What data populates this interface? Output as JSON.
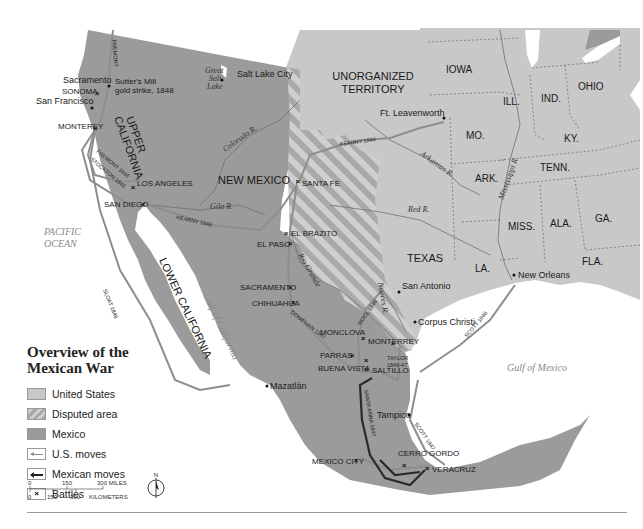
{
  "title": "Overview of the Mexican War",
  "title_lines": [
    "Overview of the",
    "Mexican War"
  ],
  "colors": {
    "united_states": "#c8c8c8",
    "mexico": "#9b9b9b",
    "disputed_stripe_a": "#a5a5a5",
    "disputed_stripe_b": "#cfcfcf",
    "us_moves": "#8e8e8e",
    "mexican_moves": "#2a2a2a",
    "water": "#ffffff"
  },
  "legend": {
    "items": [
      {
        "key": "united_states",
        "label": "United States"
      },
      {
        "key": "disputed",
        "label": "Disputed area"
      },
      {
        "key": "mexico",
        "label": "Mexico"
      },
      {
        "key": "us_moves",
        "label": "U.S. moves"
      },
      {
        "key": "mexican_moves",
        "label": "Mexican moves"
      },
      {
        "key": "battles",
        "label": "Battles",
        "symbol": "×"
      }
    ]
  },
  "scale": {
    "miles_ticks": [
      "0",
      "150",
      "300 MILES"
    ],
    "km_ticks": [
      "0",
      "150",
      "300",
      "KILOMETERS"
    ]
  },
  "compass": {
    "label": "N",
    "icon": "north-arrow-icon"
  },
  "regions": {
    "unorganized_territory": [
      "UNORGANIZED",
      "TERRITORY"
    ],
    "upper_california": [
      "UPPER",
      "CALIFORNIA"
    ],
    "lower_california": "LOWER CALIFORNIA",
    "new_mexico": "NEW MEXICO",
    "texas": "TEXAS"
  },
  "states": [
    "IOWA",
    "ILL.",
    "IND.",
    "OHIO",
    "MO.",
    "KY.",
    "TENN.",
    "ARK.",
    "MISS.",
    "ALA.",
    "GA.",
    "LA.",
    "FLA."
  ],
  "water_bodies": {
    "pacific": [
      "PACIFIC",
      "OCEAN"
    ],
    "gulf_of_mexico": "Gulf of Mexico",
    "gulf_of_california": "Gulf of California",
    "great_salt_lake": [
      "Great",
      "Salt",
      "Lake"
    ]
  },
  "rivers": [
    "Colorado R.",
    "Gila R.",
    "Rio Grande",
    "Nueces R.",
    "Arkansas R.",
    "Red R.",
    "Mississippi R."
  ],
  "cities": [
    {
      "name": "Sacramento"
    },
    {
      "name": "San Francisco"
    },
    {
      "name": "Salt Lake City"
    },
    {
      "name": "Ft. Leavenworth"
    },
    {
      "name": "San Antonio"
    },
    {
      "name": "Corpus Christi"
    },
    {
      "name": "New Orleans"
    },
    {
      "name": "Tampico"
    },
    {
      "name": "Mazatlán"
    }
  ],
  "annotations": {
    "sutters_mill": [
      "Sutter's Mill",
      "gold strike, 1848"
    ]
  },
  "battles": [
    "SONOMA",
    "MONTEREY",
    "LOS ANGELES",
    "SAN DIEGO",
    "SANTA FE",
    "EL BRAZITO",
    "EL PASO",
    "SACRAMENTO",
    "CHIHUAHUA",
    "MONCLOVA",
    "MONTERREY",
    "PARRAS",
    "BUENA VISTA",
    "SALTILLO",
    "MEXICO CITY",
    "CERRO GORDO",
    "VERACRUZ"
  ],
  "routes": {
    "fremont_north": "FREMONT",
    "fremont_south": "FREMONT 1846",
    "stockton": "STOCKTON 1846",
    "kearny_east": "KEARNY 1846",
    "kearny_west": "KEARNY 1846",
    "sloat": "SLOAT 1846",
    "doniphan": "DONIPHAN 1847",
    "wool": "WOOL 1846",
    "taylor": [
      "TAYLOR",
      "1846-47"
    ],
    "scott_1846": "SCOTT 1846",
    "scott_1847": "SCOTT 1847",
    "santa_anna": "SANTA ANNA 1847"
  }
}
